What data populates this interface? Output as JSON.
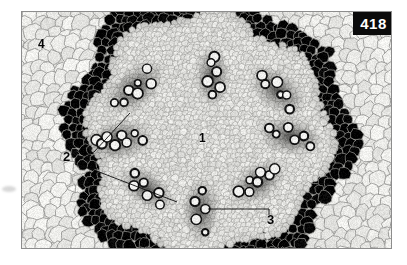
{
  "figure": {
    "kind": "light-micrograph",
    "plate_number": "418",
    "background_color": "#ffffff",
    "plate_border_color": "#8d8d8d",
    "badge": {
      "text": "418",
      "bg": "#0b0b0b",
      "fg": "#ffffff"
    }
  },
  "labels": [
    {
      "id": "1",
      "text": "1",
      "name": "label-1-pith",
      "x": 177,
      "y": 120
    },
    {
      "id": "2",
      "text": "2",
      "name": "label-2-vascular-bundle",
      "x": 41,
      "y": 138
    },
    {
      "id": "3",
      "text": "3",
      "name": "label-3-sclerenchyma",
      "x": 245,
      "y": 201
    },
    {
      "id": "4",
      "text": "4",
      "name": "label-4-cortex",
      "x": 16,
      "y": 26
    }
  ],
  "leaders": [
    {
      "name": "leader-2-upper",
      "points": "53,147 72,140 108,101"
    },
    {
      "name": "leader-2-lower",
      "points": "53,152 72,158 155,190"
    },
    {
      "name": "leader-3-horizontal",
      "points": "247,197 186,197"
    },
    {
      "name": "leader-3-tick",
      "points": "247,197 247,203"
    }
  ],
  "tissue": {
    "palette": {
      "cortex_cell_fill": "#e9e9e6",
      "cortex_wall": "#9a9a97",
      "pith_cell_fill": "#e2e2df",
      "pith_wall": "#a6a6a3",
      "bundle_dark": "#3a3a38",
      "vessel_ring": "#121212",
      "vessel_lumen": "#f0f0ee",
      "ground": "#dcdcd8"
    },
    "regions": {
      "cortex": "large light rounded parenchyma cells, outer zone",
      "pith": "smaller isodiametric parenchyma cells, central zone",
      "vascular_ring": "ring of dark vascular bundles with large xylem vessels"
    },
    "bundles": [
      {
        "name": "bundle-nw",
        "cx": 112,
        "cy": 76,
        "r": 30,
        "angle": -40,
        "vessels": 7
      },
      {
        "name": "bundle-n",
        "cx": 190,
        "cy": 64,
        "r": 26,
        "angle": 88,
        "vessels": 6
      },
      {
        "name": "bundle-ne",
        "cx": 255,
        "cy": 78,
        "r": 28,
        "angle": 40,
        "vessels": 6
      },
      {
        "name": "bundle-w",
        "cx": 96,
        "cy": 128,
        "r": 30,
        "angle": -12,
        "vessels": 8
      },
      {
        "name": "bundle-e",
        "cx": 268,
        "cy": 124,
        "r": 28,
        "angle": 10,
        "vessels": 6
      },
      {
        "name": "bundle-sw",
        "cx": 124,
        "cy": 176,
        "r": 26,
        "angle": 34,
        "vessels": 6
      },
      {
        "name": "bundle-se",
        "cx": 235,
        "cy": 170,
        "r": 27,
        "angle": -34,
        "vessels": 7
      },
      {
        "name": "bundle-s",
        "cx": 178,
        "cy": 198,
        "r": 28,
        "angle": 90,
        "vessels": 5
      }
    ]
  }
}
